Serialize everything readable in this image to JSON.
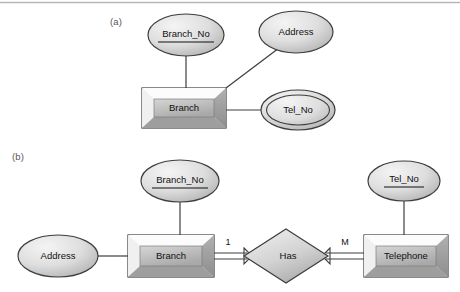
{
  "figure": {
    "type": "er-diagram",
    "background_color": "#ffffff",
    "top_rule_color": "#b6b6b6",
    "outline_color": "#3d3d3d",
    "fill_light": "#f2f2f2",
    "fill_mid": "#c9c9c9",
    "fill_dark": "#9a9a9a",
    "text_color": "#111111",
    "label_color": "#575757"
  },
  "panels": [
    {
      "id": "panel-a",
      "caption": "(a)",
      "nodes": [
        {
          "id": "a-branch-no",
          "kind": "attribute",
          "label": "Branch_No",
          "key": true,
          "multivalued": false,
          "cx": 186,
          "cy": 35,
          "rx": 38,
          "ry": 21
        },
        {
          "id": "a-address",
          "kind": "attribute",
          "label": "Address",
          "key": false,
          "multivalued": false,
          "cx": 296,
          "cy": 32,
          "rx": 37,
          "ry": 21
        },
        {
          "id": "a-tel-no",
          "kind": "attribute",
          "label": "Tel_No",
          "key": false,
          "multivalued": true,
          "cx": 298,
          "cy": 110,
          "rx": 37,
          "ry": 20
        },
        {
          "id": "a-branch",
          "kind": "entity",
          "label": "Branch",
          "x": 142,
          "y": 88,
          "w": 84,
          "h": 40
        }
      ],
      "edges": [
        {
          "id": "a-edge-branchno",
          "from": "a-branch-no",
          "to": "a-branch",
          "style": "single",
          "x1": 186,
          "y1": 56,
          "x2": 186,
          "y2": 88
        },
        {
          "id": "a-edge-address",
          "from": "a-address",
          "to": "a-branch",
          "style": "single",
          "x1": 278,
          "y1": 48,
          "x2": 226,
          "y2": 88
        },
        {
          "id": "a-edge-telno",
          "from": "a-branch",
          "to": "a-tel-no",
          "style": "single",
          "x1": 226,
          "y1": 110,
          "x2": 261,
          "y2": 110
        }
      ]
    },
    {
      "id": "panel-b",
      "caption": "(b)",
      "nodes": [
        {
          "id": "b-branch-no",
          "kind": "attribute",
          "label": "Branch_No",
          "key": true,
          "multivalued": false,
          "cx": 180,
          "cy": 181,
          "rx": 39,
          "ry": 21
        },
        {
          "id": "b-tel-no",
          "kind": "attribute",
          "label": "Tel_No",
          "key": true,
          "multivalued": false,
          "cx": 404,
          "cy": 181,
          "rx": 36,
          "ry": 20
        },
        {
          "id": "b-address",
          "kind": "attribute",
          "label": "Address",
          "key": false,
          "multivalued": false,
          "cx": 58,
          "cy": 256,
          "rx": 40,
          "ry": 21
        },
        {
          "id": "b-branch",
          "kind": "entity",
          "label": "Branch",
          "x": 128,
          "y": 235,
          "w": 86,
          "h": 42
        },
        {
          "id": "b-has",
          "kind": "relationship",
          "label": "Has",
          "cx": 286,
          "cy": 256,
          "rx": 42,
          "ry": 27
        },
        {
          "id": "b-telephone",
          "kind": "entity",
          "label": "Telephone",
          "x": 364,
          "y": 235,
          "w": 84,
          "h": 42
        }
      ],
      "edges": [
        {
          "id": "b-edge-address",
          "from": "b-address",
          "to": "b-branch",
          "style": "single",
          "x1": 98,
          "y1": 256,
          "x2": 128,
          "y2": 256
        },
        {
          "id": "b-edge-branchno",
          "from": "b-branch-no",
          "to": "b-branch",
          "style": "single",
          "x1": 180,
          "y1": 202,
          "x2": 180,
          "y2": 235
        },
        {
          "id": "b-edge-telno",
          "from": "b-tel-no",
          "to": "b-telephone",
          "style": "single",
          "x1": 404,
          "y1": 201,
          "x2": 404,
          "y2": 235
        },
        {
          "id": "b-edge-branch-has",
          "from": "b-branch",
          "to": "b-has",
          "style": "double-arrow",
          "x1": 214,
          "y1": 256,
          "x2": 244,
          "y2": 256,
          "cardinality": "1",
          "card_x": 228,
          "card_y": 243
        },
        {
          "id": "b-edge-has-phone",
          "from": "b-has",
          "to": "b-telephone",
          "style": "double-arrow",
          "x1": 328,
          "y1": 256,
          "x2": 364,
          "y2": 256,
          "cardinality": "M",
          "card_x": 345,
          "card_y": 243
        }
      ]
    }
  ]
}
